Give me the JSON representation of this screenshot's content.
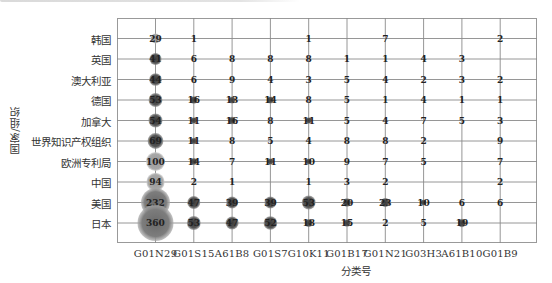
{
  "chart_data": {
    "type": "scatter",
    "subtype": "bubble-matrix",
    "title": "",
    "xlabel": "分类号",
    "ylabel": "国家/组织",
    "grid": true,
    "categories_x": [
      "G01N29",
      "G01S15",
      "A61B8",
      "G01S7",
      "G10K11",
      "G01B17",
      "G01N21",
      "G03H3",
      "A61B10",
      "G01B9"
    ],
    "categories_y": [
      "韩国",
      "英国",
      "澳大利亚",
      "德国",
      "加拿大",
      "世界知识产权组织",
      "欧洲专利局",
      "中国",
      "美国",
      "日本"
    ],
    "series": [
      {
        "name": "韩国",
        "values": [
          29,
          1,
          null,
          null,
          1,
          null,
          7,
          null,
          null,
          2
        ]
      },
      {
        "name": "英国",
        "values": [
          41,
          6,
          8,
          8,
          8,
          1,
          1,
          4,
          3,
          null
        ]
      },
      {
        "name": "澳大利亚",
        "values": [
          44,
          6,
          9,
          4,
          3,
          5,
          4,
          2,
          3,
          2
        ]
      },
      {
        "name": "德国",
        "values": [
          53,
          16,
          13,
          14,
          8,
          5,
          1,
          4,
          1,
          1
        ]
      },
      {
        "name": "加拿大",
        "values": [
          54,
          11,
          16,
          8,
          11,
          5,
          4,
          7,
          5,
          3
        ]
      },
      {
        "name": "世界知识产权组织",
        "values": [
          69,
          11,
          8,
          5,
          4,
          8,
          8,
          2,
          null,
          9
        ]
      },
      {
        "name": "欧洲专利局",
        "values": [
          100,
          14,
          7,
          11,
          10,
          9,
          7,
          5,
          null,
          7
        ]
      },
      {
        "name": "中国",
        "values": [
          94,
          2,
          1,
          null,
          1,
          3,
          2,
          null,
          null,
          2
        ]
      },
      {
        "name": "美国",
        "values": [
          232,
          47,
          39,
          39,
          53,
          20,
          23,
          10,
          6,
          6
        ]
      },
      {
        "name": "日本",
        "values": [
          360,
          53,
          47,
          52,
          18,
          15,
          2,
          5,
          19,
          null
        ]
      }
    ]
  },
  "axes": {
    "x_title": "分类号",
    "y_title": "国家/组织"
  }
}
